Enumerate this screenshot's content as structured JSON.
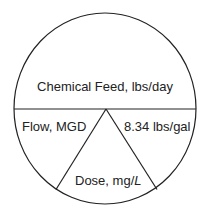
{
  "diagram": {
    "type": "formula-wheel",
    "line_color": "#222222",
    "background": "#ffffff",
    "sections": {
      "top": {
        "label": "Chemical Feed, lbs/day"
      },
      "bottom_left": {
        "label": "Flow, MGD"
      },
      "bottom_right": {
        "label": "8.34 lbs/gal"
      },
      "bottom_center": {
        "label_main": "Dose, mg/",
        "label_unit": "L"
      }
    }
  }
}
